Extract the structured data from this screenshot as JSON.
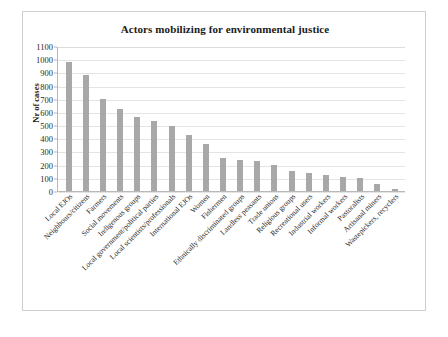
{
  "chart_data": {
    "type": "bar",
    "title": "Actors mobilizing for environmental justice",
    "xlabel": "",
    "ylabel": "Nr of cases",
    "ylim": [
      0,
      1100
    ],
    "ytick_step": 100,
    "yticks": [
      "1100",
      "1000",
      "900",
      "800",
      "700",
      "600",
      "500",
      "400",
      "300",
      "200",
      "100",
      "0"
    ],
    "grid": true,
    "legend": "none",
    "bar_color": "#a8a8a8",
    "categories": [
      "Local EJOs",
      "Neighbours/citizens",
      "Farmers",
      "Social movements",
      "Indigenous groups",
      "Local government/political parties",
      "Local scientists/professionals",
      "International EJOs",
      "Women",
      "Fishermen",
      "Ethnically discriminated groups",
      "Landless peasants",
      "Trade unions",
      "Religious groups",
      "Recreational users",
      "Industrial workers",
      "Informal workers",
      "Pastoralists",
      "Artisanal miners",
      "Wastepickers, recyclers"
    ],
    "values": [
      975,
      880,
      700,
      625,
      565,
      530,
      495,
      425,
      355,
      250,
      235,
      225,
      195,
      150,
      140,
      120,
      110,
      100,
      55,
      18
    ]
  }
}
